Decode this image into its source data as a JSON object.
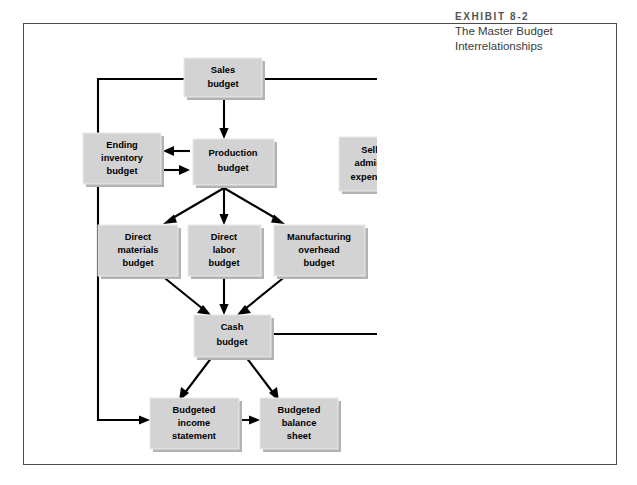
{
  "exhibit": {
    "label": "EXHIBIT 8-2",
    "title_line1": "The Master Budget",
    "title_line2": "Interrelationships"
  },
  "colors": {
    "box_fill": "#d3d3d3",
    "box_shadow": "#b3b3b3",
    "box_highlight": "#eaeaea",
    "line": "#000000",
    "frame": "#4a4a4a",
    "caption_label": "#555555",
    "caption_title": "#3a3a3a",
    "background": "#ffffff"
  },
  "diagram": {
    "type": "flowchart",
    "nodes": [
      {
        "id": "sales",
        "lines": [
          "Sales",
          "budget"
        ]
      },
      {
        "id": "ending_inv",
        "lines": [
          "Ending",
          "inventory",
          "budget"
        ]
      },
      {
        "id": "production",
        "lines": [
          "Production",
          "budget"
        ]
      },
      {
        "id": "selling_admin",
        "lines": [
          "Selling and",
          "administrative",
          "expense budget"
        ]
      },
      {
        "id": "direct_mat",
        "lines": [
          "Direct",
          "materials",
          "budget"
        ]
      },
      {
        "id": "direct_lab",
        "lines": [
          "Direct",
          "labor",
          "budget"
        ]
      },
      {
        "id": "mfg_oh",
        "lines": [
          "Manufacturing",
          "overhead",
          "budget"
        ]
      },
      {
        "id": "cash",
        "lines": [
          "Cash",
          "budget"
        ]
      },
      {
        "id": "income_stmt",
        "lines": [
          "Budgeted",
          "income",
          "statement"
        ]
      },
      {
        "id": "balance_sheet",
        "lines": [
          "Budgeted",
          "balance",
          "sheet"
        ]
      }
    ],
    "edges": [
      {
        "from": "sales",
        "to": "production"
      },
      {
        "from": "sales",
        "to": "selling_admin"
      },
      {
        "from": "sales",
        "to": "income_stmt"
      },
      {
        "from": "production",
        "to": "ending_inv"
      },
      {
        "from": "ending_inv",
        "to": "production"
      },
      {
        "from": "production",
        "to": "direct_mat"
      },
      {
        "from": "production",
        "to": "direct_lab"
      },
      {
        "from": "production",
        "to": "mfg_oh"
      },
      {
        "from": "direct_mat",
        "to": "cash"
      },
      {
        "from": "direct_lab",
        "to": "cash"
      },
      {
        "from": "mfg_oh",
        "to": "cash"
      },
      {
        "from": "selling_admin",
        "to": "cash"
      },
      {
        "from": "selling_admin",
        "to": "income_stmt"
      },
      {
        "from": "cash",
        "to": "income_stmt"
      },
      {
        "from": "cash",
        "to": "balance_sheet"
      },
      {
        "from": "income_stmt",
        "to": "balance_sheet"
      }
    ]
  }
}
